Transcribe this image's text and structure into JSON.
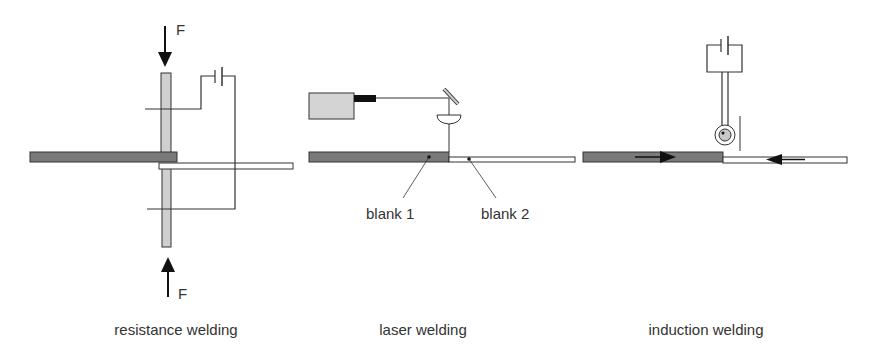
{
  "colors": {
    "blank_dark": "#7a7a7a",
    "blank_light": "#ffffff",
    "electrode": "#cfcfcf",
    "laser_body": "#d4d4d4",
    "line": "#333333",
    "coil_core": "#c8c8c8"
  },
  "panels": {
    "resistance": {
      "caption": "resistance welding",
      "force_top": "F",
      "force_bottom": "F"
    },
    "laser": {
      "caption": "laser welding",
      "blank1_label": "blank 1",
      "blank2_label": "blank 2"
    },
    "induction": {
      "caption": "induction welding"
    }
  }
}
